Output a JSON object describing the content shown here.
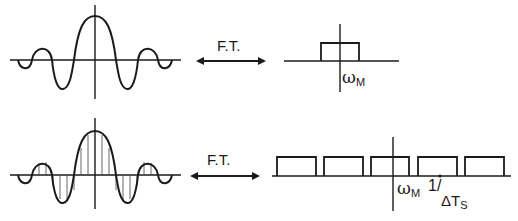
{
  "top_row": {
    "time_domain": {
      "description": "sinc-like continuous signal"
    },
    "arrow_label": "F.T.",
    "freq_domain": {
      "description": "single rectangular spectrum",
      "band_label_main": "ω",
      "band_label_sub": "M"
    }
  },
  "bottom_row": {
    "time_domain": {
      "description": "sampled signal (stems at regular interval)"
    },
    "arrow_label": "F.T.",
    "freq_domain": {
      "description": "periodic replicated rectangular spectra",
      "replica_count": 5,
      "band_label_main": "ω",
      "band_label_sub": "M",
      "period_label_num": "1/",
      "period_label_den_main": "ΔT",
      "period_label_den_sub": "S"
    }
  },
  "colors": {
    "stroke": "#1a1a1a",
    "background": "#ffffff"
  }
}
